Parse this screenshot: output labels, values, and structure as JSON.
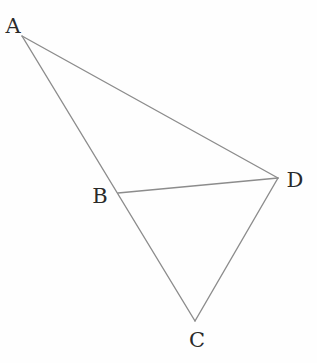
{
  "diagram": {
    "type": "geometry",
    "line_color": "#8c8c8c",
    "label_color": "#2a2a2a",
    "background": "#ffffff",
    "points": {
      "A": {
        "label": "A",
        "x": 22,
        "y": 36,
        "label_x": 13,
        "label_y": 26
      },
      "B": {
        "label": "B",
        "x": 118,
        "y": 193,
        "label_x": 100,
        "label_y": 196
      },
      "C": {
        "label": "C",
        "x": 195,
        "y": 321,
        "label_x": 197,
        "label_y": 340
      },
      "D": {
        "label": "D",
        "x": 278,
        "y": 178,
        "label_x": 295,
        "label_y": 180
      }
    },
    "segments": [
      {
        "from": "A",
        "to": "C",
        "note": "A, B, C collinear"
      },
      {
        "from": "A",
        "to": "D"
      },
      {
        "from": "B",
        "to": "D"
      },
      {
        "from": "D",
        "to": "C"
      }
    ]
  }
}
